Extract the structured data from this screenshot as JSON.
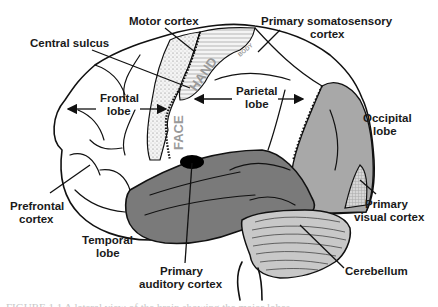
{
  "figure": {
    "labels": {
      "motor_cortex": "Motor cortex",
      "primary_somatosensory_line1": "Primary  somatosensory",
      "primary_somatosensory_line2": "cortex",
      "central_sulcus": "Central sulcus",
      "frontal_lobe_line1": "Frontal",
      "frontal_lobe_line2": "lobe",
      "parietal_lobe_line1": "Parietal",
      "parietal_lobe_line2": "lobe",
      "occipital_lobe_line1": "Occipital",
      "occipital_lobe_line2": "lobe",
      "prefrontal_cortex_line1": "Prefrontal",
      "prefrontal_cortex_line2": "cortex",
      "temporal_lobe_line1": "Temporal",
      "temporal_lobe_line2": "lobe",
      "primary_auditory_line1": "Primary",
      "primary_auditory_line2": "auditory cortex",
      "primary_visual_line1": "Primary",
      "primary_visual_line2": "visual cortex",
      "cerebellum": "Cerebellum"
    },
    "inner_text": {
      "face": "FACE",
      "hand": "HAND",
      "body": "BODY"
    },
    "colors": {
      "temporal_fill": "#7a7a7a",
      "occipital_fill": "#a8a8a8",
      "cerebellum_fill": "#c8c8c8",
      "auditory_fill": "#000000",
      "somatosensory_fill": "#eeeeee",
      "motor_dots": "#888888"
    },
    "caption": "FIGURE 1.1  A lateral view of the brain showing the major lobes"
  }
}
